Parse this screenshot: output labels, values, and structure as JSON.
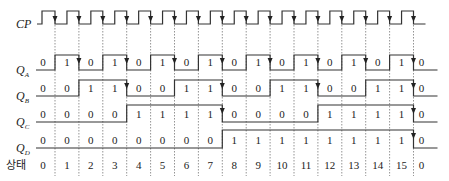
{
  "diagram": {
    "type": "timing-diagram",
    "signals": [
      {
        "name": "CP",
        "sub": "",
        "label": "CP"
      },
      {
        "name": "Q",
        "sub": "A",
        "label": "QA"
      },
      {
        "name": "Q",
        "sub": "B",
        "label": "QB"
      },
      {
        "name": "Q",
        "sub": "C",
        "label": "QC"
      },
      {
        "name": "Q",
        "sub": "D",
        "label": "QD"
      }
    ],
    "values": {
      "QA": [
        "0",
        "1",
        "0",
        "1",
        "0",
        "1",
        "0",
        "1",
        "0",
        "1",
        "0",
        "1",
        "0",
        "1",
        "0",
        "1",
        "0"
      ],
      "QB": [
        "0",
        "0",
        "1",
        "1",
        "0",
        "0",
        "1",
        "1",
        "0",
        "0",
        "1",
        "1",
        "0",
        "0",
        "1",
        "1",
        "0"
      ],
      "QC": [
        "0",
        "0",
        "0",
        "0",
        "1",
        "1",
        "1",
        "1",
        "0",
        "0",
        "0",
        "0",
        "1",
        "1",
        "1",
        "1",
        "0"
      ],
      "QD": [
        "0",
        "0",
        "0",
        "0",
        "0",
        "0",
        "0",
        "0",
        "1",
        "1",
        "1",
        "1",
        "1",
        "1",
        "1",
        "1",
        "0"
      ]
    },
    "state_label": "상태",
    "states": [
      "0",
      "1",
      "2",
      "3",
      "4",
      "5",
      "6",
      "7",
      "8",
      "9",
      "10",
      "11",
      "12",
      "13",
      "14",
      "15",
      "0"
    ],
    "clock_edges": 16
  }
}
